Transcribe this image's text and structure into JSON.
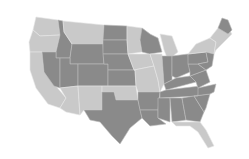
{
  "map": {
    "title": "",
    "colors": {
      "light": "#c9c9c9",
      "dark": "#8a8a8a",
      "background": "#ffffff"
    },
    "regions": [
      {
        "id": "wa",
        "shade": "light",
        "points": "36,17 58,20 60,35 40,36 33,30"
      },
      {
        "id": "or",
        "shade": "light",
        "points": "33,30 40,36 60,35 56,52 30,52 29,42"
      },
      {
        "id": "ca",
        "shade": "light",
        "points": "30,52 42,52 44,72 66,98 60,108 48,104 36,88 30,70"
      },
      {
        "id": "id",
        "shade": "dark",
        "points": "58,20 63,21 64,32 72,44 70,58 56,58 56,52 60,35"
      },
      {
        "id": "nv",
        "shade": "dark",
        "points": "42,52 56,52 56,58 60,58 60,88 54,86 44,72"
      },
      {
        "id": "mt",
        "shade": "light",
        "points": "63,21 104,25 103,44 72,44 64,32"
      },
      {
        "id": "wy",
        "shade": "dark",
        "points": "72,44 103,44 104,64 70,64 70,58"
      },
      {
        "id": "ut",
        "shade": "dark",
        "points": "60,58 70,58 70,64 78,64 78,86 60,88"
      },
      {
        "id": "co",
        "shade": "dark",
        "points": "78,64 108,64 108,86 78,86"
      },
      {
        "id": "az",
        "shade": "light",
        "points": "60,88 78,86 80,115 66,112 60,108 66,98"
      },
      {
        "id": "nm",
        "shade": "light",
        "points": "78,86 102,86 102,110 84,110 80,115"
      },
      {
        "id": "nd",
        "shade": "dark",
        "points": "104,25 127,26 127,40 103,40"
      },
      {
        "id": "sd",
        "shade": "dark",
        "points": "103,40 127,40 128,54 103,54"
      },
      {
        "id": "ne",
        "shade": "dark",
        "points": "103,54 128,54 134,70 108,70 108,64 104,64"
      },
      {
        "id": "ks",
        "shade": "dark",
        "points": "108,70 135,70 136,86 108,86"
      },
      {
        "id": "ok",
        "shade": "light",
        "points": "102,86 136,86 138,100 116,100 114,92 102,92"
      },
      {
        "id": "tx",
        "shade": "dark",
        "points": "102,92 114,92 116,100 138,100 142,118 130,128 120,144 112,136 100,122 90,120 84,110 102,110"
      },
      {
        "id": "mn",
        "shade": "light",
        "points": "127,26 142,28 150,34 140,40 142,52 128,54 127,40"
      },
      {
        "id": "ia",
        "shade": "light",
        "points": "128,54 150,54 154,66 134,70"
      },
      {
        "id": "mo",
        "shade": "light",
        "points": "134,70 154,66 158,80 160,92 138,92 136,86 135,70"
      },
      {
        "id": "ar",
        "shade": "dark",
        "points": "138,92 160,92 158,110 140,110 138,100"
      },
      {
        "id": "la",
        "shade": "dark",
        "points": "140,110 158,110 158,118 166,124 150,126 142,118"
      },
      {
        "id": "wi",
        "shade": "dark",
        "points": "142,28 150,34 158,38 162,52 150,54 142,52 140,40"
      },
      {
        "id": "il",
        "shade": "light",
        "points": "150,54 162,54 164,84 160,92 158,80 154,66"
      },
      {
        "id": "mi",
        "shade": "light",
        "points": "160,34 172,36 178,52 168,60 164,50"
      },
      {
        "id": "in",
        "shade": "dark",
        "points": "162,56 172,56 172,80 164,84"
      },
      {
        "id": "oh",
        "shade": "dark",
        "points": "172,56 188,54 190,72 176,78 172,76"
      },
      {
        "id": "ky",
        "shade": "dark",
        "points": "164,84 176,78 190,76 196,82 166,90"
      },
      {
        "id": "tn",
        "shade": "dark",
        "points": "160,92 166,90 200,86 198,96 160,98"
      },
      {
        "id": "ms",
        "shade": "dark",
        "points": "158,98 170,98 170,122 158,118 158,110"
      },
      {
        "id": "al",
        "shade": "dark",
        "points": "170,98 182,98 186,120 172,122"
      },
      {
        "id": "ga",
        "shade": "dark",
        "points": "182,98 194,96 204,112 200,122 186,120"
      },
      {
        "id": "fl",
        "shade": "light",
        "points": "172,122 200,122 206,130 214,146 208,148 198,132 190,126 176,126"
      },
      {
        "id": "sc",
        "shade": "dark",
        "points": "194,96 210,94 206,108 204,112"
      },
      {
        "id": "nc",
        "shade": "dark",
        "points": "198,88 216,84 214,92 210,94 194,96 198,96"
      },
      {
        "id": "va",
        "shade": "dark",
        "points": "190,76 206,70 210,82 198,88 196,82"
      },
      {
        "id": "wv",
        "shade": "dark",
        "points": "188,64 198,64 206,70 190,76 190,72"
      },
      {
        "id": "pa",
        "shade": "dark",
        "points": "188,54 206,52 208,62 198,64 188,64"
      },
      {
        "id": "ny",
        "shade": "light",
        "points": "188,54 196,44 210,38 216,42 214,54 206,52"
      },
      {
        "id": "ne_states",
        "shade": "light",
        "points": "210,38 218,28 222,22 228,28 232,34 222,44 216,50 214,54 216,42"
      },
      {
        "id": "me",
        "shade": "dark",
        "points": "218,28 222,18 228,20 232,30 228,34"
      },
      {
        "id": "nj_md_de",
        "shade": "dark",
        "points": "206,52 214,54 212,66 206,70 198,64 208,62"
      }
    ]
  }
}
